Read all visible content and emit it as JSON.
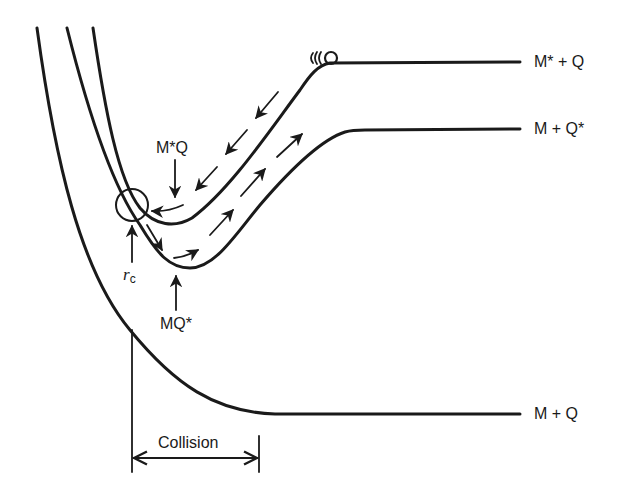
{
  "diagram": {
    "type": "potential-energy-curves",
    "curves": [
      {
        "id": "upper",
        "label": "M* + Q",
        "description": "excited donor + quencher asymptote"
      },
      {
        "id": "middle",
        "label": "M + Q*",
        "description": "ground donor + excited quencher asymptote"
      },
      {
        "id": "ground",
        "label": "M + Q",
        "description": "ground-state asymptote"
      }
    ],
    "annotations": {
      "upper_well": "M*Q",
      "middle_well": "MQ*",
      "crossing_radius_symbol": "r",
      "crossing_radius_subscript": "c",
      "collision_label": "Collision"
    },
    "colors": {
      "ink": "#1a1a1a",
      "background": "#ffffff"
    }
  }
}
